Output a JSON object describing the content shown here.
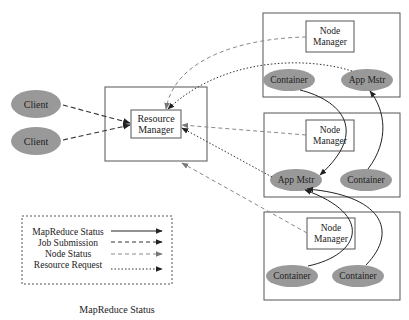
{
  "diagram": {
    "caption": "MapReduce Status",
    "resource_manager": {
      "label_line1": "Resource",
      "label_line2": "Manager"
    },
    "clients": [
      {
        "label": "Client"
      },
      {
        "label": "Client"
      }
    ],
    "nodes": [
      {
        "node_manager": {
          "label_line1": "Node",
          "label_line2": "Manager"
        },
        "left_ellipse": "Container",
        "right_ellipse": "App Mstr"
      },
      {
        "node_manager": {
          "label_line1": "Node",
          "label_line2": "Manager"
        },
        "left_ellipse": "App Mstr",
        "right_ellipse": "Container"
      },
      {
        "node_manager": {
          "label_line1": "Node",
          "label_line2": "Manager"
        },
        "left_ellipse": "Container",
        "right_ellipse": "Container"
      }
    ],
    "legend": {
      "items": [
        {
          "label": "MapReduce Status",
          "style": "solid"
        },
        {
          "label": "Job Submission",
          "style": "dashed"
        },
        {
          "label": "Node Status",
          "style": "dashed-light"
        },
        {
          "label": "Resource Request",
          "style": "dotted"
        }
      ]
    },
    "colors": {
      "ellipse_fill": "#999999",
      "box_stroke": "#555555",
      "arrow_dark": "#333333",
      "arrow_light": "#888888"
    }
  }
}
